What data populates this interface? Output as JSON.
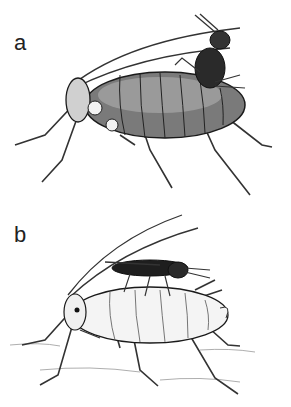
{
  "figure": {
    "panels": [
      {
        "label": "a",
        "description": "Dark-bodied aphid with a parasitoid wasp perched on its back, ovipositing"
      },
      {
        "label": "b",
        "description": "Pale aphid with a dark winged parasitoid wasp lying on its back, on a textured surface"
      }
    ],
    "colors": {
      "ink": "#1a1a1a",
      "background": "#ffffff",
      "shade": "#6b6b6b",
      "pale": "#e8e8e8"
    }
  }
}
